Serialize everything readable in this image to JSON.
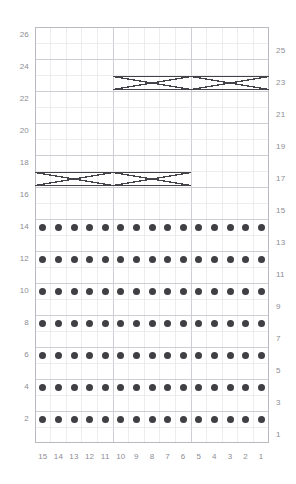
{
  "chart_data": {
    "type": "table",
    "title": "",
    "subtitle": "",
    "xlabel": "",
    "ylabel": "",
    "grid": {
      "columns": 15,
      "rows": 26,
      "cell_width": 15.6,
      "cell_height": 16.0,
      "grid_on": true,
      "x_origin": 35,
      "y_origin": 27,
      "width": 234,
      "height": 416
    },
    "column_labels": [
      "15",
      "14",
      "13",
      "12",
      "11",
      "10",
      "9",
      "8",
      "7",
      "6",
      "5",
      "4",
      "3",
      "2",
      "1"
    ],
    "row_labels_left": [
      "26",
      "24",
      "22",
      "20",
      "18",
      "16",
      "14",
      "12",
      "10",
      "8",
      "6",
      "4",
      "2"
    ],
    "row_labels_right": [
      "25",
      "23",
      "21",
      "19",
      "17",
      "15",
      "13",
      "11",
      "9",
      "7",
      "5",
      "3",
      "1"
    ],
    "left_label_rows": [
      26,
      24,
      22,
      20,
      18,
      16,
      14,
      12,
      10,
      8,
      6,
      4,
      2
    ],
    "right_label_rows": [
      25,
      23,
      21,
      19,
      17,
      15,
      13,
      11,
      9,
      7,
      5,
      3,
      1
    ],
    "symbols": {
      "dot": {
        "name": "purl-dot",
        "color": "#3f3f44",
        "radius": 3.5
      },
      "cable": {
        "name": "cable-cross",
        "color": "#43434a",
        "stroke_width": 1.4,
        "span_columns": 5
      }
    },
    "dot_rows": [
      14,
      12,
      10,
      8,
      6,
      4,
      2
    ],
    "dot_row_columns": [
      1,
      2,
      3,
      4,
      5,
      6,
      7,
      8,
      9,
      10,
      11,
      12,
      13,
      14,
      15
    ],
    "cables": [
      {
        "row": 23,
        "col_start": 1,
        "col_end": 5,
        "label": "cable-row23-left"
      },
      {
        "row": 23,
        "col_start": 6,
        "col_end": 10,
        "label": "cable-row23-right"
      },
      {
        "row": 17,
        "col_start": 6,
        "col_end": 10,
        "label": "cable-row17-left"
      },
      {
        "row": 17,
        "col_start": 11,
        "col_end": 15,
        "label": "cable-row17-right"
      }
    ],
    "colors": {
      "background": "#ffffff",
      "grid_minor": "#e6e6ea",
      "grid_major": "#c9c9cf",
      "border": "#b9b9c0",
      "label_text": "#8d8d93",
      "symbol": "#3f3f44"
    },
    "axis_ranges": {
      "rows": [
        1,
        26
      ],
      "columns": [
        1,
        15
      ]
    },
    "legend": [],
    "annotations": []
  }
}
